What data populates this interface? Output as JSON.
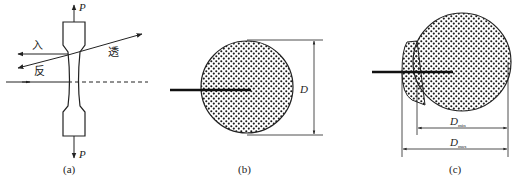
{
  "figure": {
    "panels": [
      {
        "id": "a",
        "caption": "(a)",
        "load_top": "P",
        "load_bottom": "P",
        "ray_labels": {
          "incident": "入",
          "reflected": "反",
          "transmitted": "透"
        }
      },
      {
        "id": "b",
        "caption": "(b)",
        "dimension_label": "D"
      },
      {
        "id": "c",
        "caption": "(c)",
        "dimension_min_label": "D",
        "dimension_min_sub": "min",
        "dimension_max_label": "D",
        "dimension_max_sub": "max"
      }
    ],
    "colors": {
      "stroke": "#222222",
      "background": "#ffffff"
    }
  }
}
